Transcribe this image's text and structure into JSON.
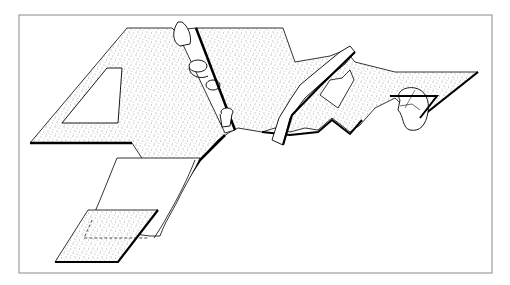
{
  "figure": {
    "colors": {
      "background": "#ffffff",
      "frame": "#888888",
      "ink": "#000000",
      "stipple": "#333333"
    },
    "frame": {
      "x": 19,
      "y": 15,
      "width": 473,
      "height": 258
    },
    "elements": [
      {
        "name": "main-stippled-slab"
      },
      {
        "name": "rectangular-cutout"
      },
      {
        "name": "clamp-rod-with-rings"
      },
      {
        "name": "raised-ridge-flap"
      },
      {
        "name": "rolled-corner-flap"
      },
      {
        "name": "folded-strip"
      },
      {
        "name": "lower-stippled-pad"
      }
    ]
  }
}
